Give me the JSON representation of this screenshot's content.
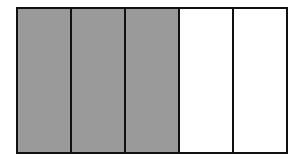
{
  "diagram": {
    "type": "fraction-bar",
    "total_parts": 5,
    "shaded_parts": 3,
    "fraction": "3/5",
    "colors": {
      "shaded": "#9a9a9a",
      "unshaded": "#ffffff",
      "border": "#111111"
    },
    "parts": [
      {
        "shaded": true
      },
      {
        "shaded": true
      },
      {
        "shaded": true
      },
      {
        "shaded": false
      },
      {
        "shaded": false
      }
    ]
  }
}
